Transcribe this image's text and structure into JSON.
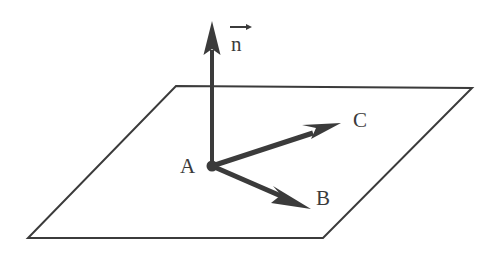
{
  "figure": {
    "background_color": "#ffffff",
    "ink_color": "#3b3b3b",
    "width": 500,
    "height": 258
  },
  "labels": {
    "point_a": "A",
    "vector_b": "B",
    "vector_c": "C",
    "vector_n": "n"
  },
  "geometry": {
    "plane": {
      "name": "parallelogram-plane",
      "corners": [
        {
          "name": "top-left",
          "x": 176,
          "y": 86
        },
        {
          "name": "top-right",
          "x": 472,
          "y": 88
        },
        {
          "name": "bottom-right",
          "x": 323,
          "y": 238
        },
        {
          "name": "bottom-left",
          "x": 28,
          "y": 238
        }
      ],
      "stroke_width": 2
    },
    "origin": {
      "name": "point-A",
      "x": 212,
      "y": 166,
      "radius": 5
    },
    "vectors": [
      {
        "name": "normal-vector-n",
        "label": "n",
        "from": {
          "x": 212,
          "y": 166
        },
        "to": {
          "x": 212,
          "y": 22
        },
        "shaft_width": 4,
        "head_length": 32,
        "head_width": 17,
        "head_style": "solid-triangle"
      },
      {
        "name": "vector-c",
        "label": "C",
        "from": {
          "x": 212,
          "y": 166
        },
        "to": {
          "x": 341,
          "y": 124
        },
        "shaft_width": 5,
        "head_length": 36,
        "head_width": 23,
        "head_style": "barbed"
      },
      {
        "name": "vector-b",
        "label": "B",
        "from": {
          "x": 212,
          "y": 166
        },
        "to": {
          "x": 311,
          "y": 209
        },
        "shaft_width": 5,
        "head_length": 36,
        "head_width": 23,
        "head_style": "barbed"
      }
    ],
    "overarrow_n": {
      "name": "vector-overbar-arrow",
      "x1": 1,
      "y1": 7,
      "x2": 22,
      "y2": 7
    }
  }
}
